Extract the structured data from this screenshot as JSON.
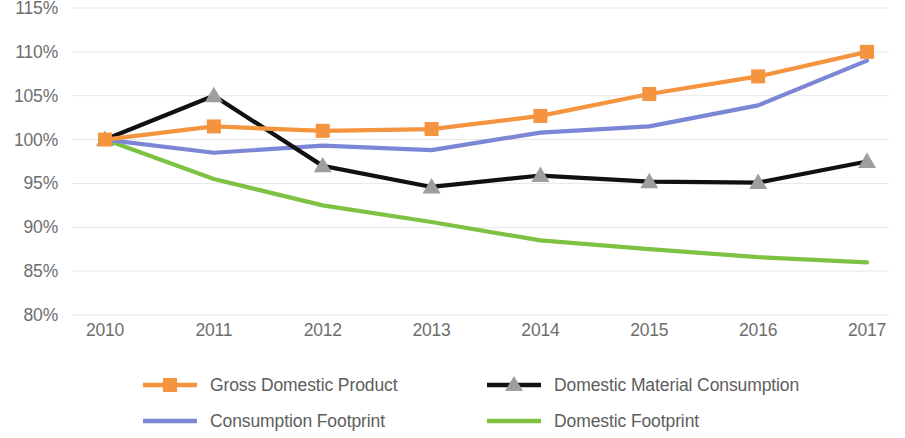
{
  "chart_data": {
    "type": "line",
    "title": "",
    "subtitle": "",
    "xlabel": "",
    "ylabel": "",
    "categories": [
      "2010",
      "2011",
      "2012",
      "2013",
      "2014",
      "2015",
      "2016",
      "2017"
    ],
    "x": [
      2010,
      2011,
      2012,
      2013,
      2014,
      2015,
      2016,
      2017
    ],
    "ylim": [
      80,
      115
    ],
    "ytick_values": [
      115,
      110,
      105,
      100,
      95,
      90,
      85,
      80
    ],
    "ytick_labels": [
      "115%",
      "110%",
      "105%",
      "100%",
      "95%",
      "90%",
      "85%",
      "80%"
    ],
    "grid": true,
    "grid_axis": "y",
    "legend_position": "bottom",
    "series": [
      {
        "name": "Gross Domestic Product",
        "color": "#F5943F",
        "marker": "square",
        "marker_color": "#F5943F",
        "values": [
          100,
          101.5,
          101,
          101.2,
          102.7,
          105.2,
          107.2,
          110
        ]
      },
      {
        "name": "Domestic Material Consumption",
        "color": "#111111",
        "marker": "triangle",
        "marker_color": "#9e9e9e",
        "values": [
          100,
          105,
          97,
          94.6,
          95.9,
          95.2,
          95.1,
          97.5
        ]
      },
      {
        "name": "Consumption Footprint",
        "color": "#7B86D4",
        "marker": "none",
        "marker_color": "#7B86D4",
        "values": [
          100,
          98.5,
          99.3,
          98.8,
          100.8,
          101.5,
          103.9,
          109
        ]
      },
      {
        "name": "Domestic Footprint",
        "color": "#7DC242",
        "marker": "none",
        "marker_color": "#7DC242",
        "values": [
          100,
          95.5,
          92.5,
          90.6,
          88.5,
          87.5,
          86.6,
          86
        ]
      }
    ]
  },
  "legend": {
    "items": [
      {
        "label": "Gross Domestic Product"
      },
      {
        "label": "Domestic Material Consumption"
      },
      {
        "label": "Consumption Footprint"
      },
      {
        "label": "Domestic Footprint"
      }
    ]
  },
  "colors": {
    "gdp": "#F5943F",
    "dmc": "#111111",
    "dmc_marker": "#9e9e9e",
    "consumption_footprint": "#7B86D4",
    "domestic_footprint": "#7DC242",
    "gridline": "#e8e8e8",
    "axis_text": "#6e6e6e",
    "legend_text": "#5d5d5d",
    "background": "#ffffff"
  }
}
